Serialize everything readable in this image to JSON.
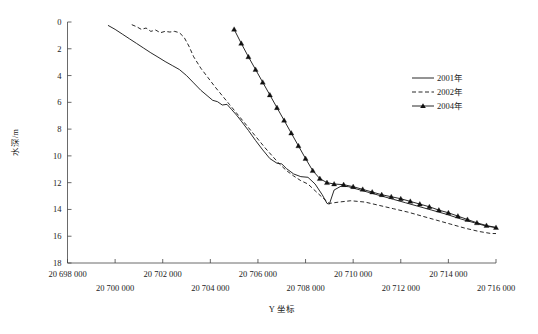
{
  "chart_data": {
    "type": "line",
    "title": "",
    "xlabel": "Y 坐标",
    "ylabel": "水深/m",
    "xlim": [
      20698000,
      20716000
    ],
    "ylim": [
      0,
      18
    ],
    "y_inverted": true,
    "grid": false,
    "legend_position": "right",
    "xticks": [
      20698000,
      20700000,
      20702000,
      20704000,
      20706000,
      20708000,
      20710000,
      20712000,
      20714000,
      20716000
    ],
    "xtick_labels": [
      "20 698 000",
      "20 700 000",
      "20 702 000",
      "20 704 000",
      "20 706 000",
      "20 708 000",
      "20 710 000",
      "20 712 000",
      "20 714 000",
      "20 716 000"
    ],
    "yticks": [
      0,
      2,
      4,
      6,
      8,
      10,
      12,
      14,
      16,
      18
    ],
    "ytick_labels": [
      "0",
      "2",
      "4",
      "6",
      "8",
      "10",
      "12",
      "14",
      "16",
      "18"
    ],
    "series": [
      {
        "name": "2001年",
        "style": "solid",
        "marker": "none",
        "color": "#111111",
        "points": [
          [
            20699700,
            0.25
          ],
          [
            20700000,
            0.55
          ],
          [
            20700300,
            0.9
          ],
          [
            20700600,
            1.25
          ],
          [
            20700900,
            1.6
          ],
          [
            20701200,
            1.95
          ],
          [
            20701500,
            2.3
          ],
          [
            20701800,
            2.62
          ],
          [
            20702100,
            2.95
          ],
          [
            20702400,
            3.25
          ],
          [
            20702700,
            3.55
          ],
          [
            20703000,
            4.0
          ],
          [
            20703300,
            4.55
          ],
          [
            20703600,
            5.1
          ],
          [
            20703900,
            5.55
          ],
          [
            20704100,
            5.85
          ],
          [
            20704300,
            5.95
          ],
          [
            20704500,
            6.2
          ],
          [
            20704700,
            6.15
          ],
          [
            20704900,
            6.55
          ],
          [
            20705100,
            6.95
          ],
          [
            20705300,
            7.4
          ],
          [
            20705600,
            8.1
          ],
          [
            20705900,
            8.85
          ],
          [
            20706200,
            9.55
          ],
          [
            20706500,
            10.2
          ],
          [
            20706800,
            10.55
          ],
          [
            20707000,
            10.6
          ],
          [
            20707200,
            10.95
          ],
          [
            20707500,
            11.35
          ],
          [
            20707800,
            11.55
          ],
          [
            20708100,
            11.6
          ],
          [
            20708400,
            12.1
          ],
          [
            20708700,
            12.9
          ],
          [
            20708900,
            13.55
          ],
          [
            20709000,
            13.6
          ],
          [
            20709200,
            12.55
          ],
          [
            20709500,
            12.25
          ],
          [
            20709800,
            12.3
          ],
          [
            20710200,
            12.5
          ],
          [
            20710700,
            12.75
          ],
          [
            20711200,
            13.0
          ],
          [
            20711700,
            13.25
          ],
          [
            20712200,
            13.5
          ],
          [
            20712700,
            13.75
          ],
          [
            20713300,
            14.05
          ],
          [
            20713900,
            14.35
          ],
          [
            20714500,
            14.7
          ],
          [
            20715100,
            15.0
          ],
          [
            20715600,
            15.25
          ],
          [
            20716000,
            15.35
          ]
        ]
      },
      {
        "name": "2002年",
        "style": "dashed",
        "marker": "none",
        "color": "#111111",
        "points": [
          [
            20700700,
            0.2
          ],
          [
            20700900,
            0.35
          ],
          [
            20701100,
            0.55
          ],
          [
            20701300,
            0.45
          ],
          [
            20701500,
            0.7
          ],
          [
            20701700,
            0.6
          ],
          [
            20701900,
            0.8
          ],
          [
            20702100,
            0.7
          ],
          [
            20702300,
            0.75
          ],
          [
            20702500,
            0.7
          ],
          [
            20702700,
            0.8
          ],
          [
            20702900,
            1.15
          ],
          [
            20703100,
            1.8
          ],
          [
            20703300,
            2.6
          ],
          [
            20703600,
            3.45
          ],
          [
            20703900,
            4.15
          ],
          [
            20704200,
            4.85
          ],
          [
            20704500,
            5.5
          ],
          [
            20704800,
            6.15
          ],
          [
            20705100,
            6.8
          ],
          [
            20705400,
            7.45
          ],
          [
            20705700,
            8.1
          ],
          [
            20706000,
            8.75
          ],
          [
            20706300,
            9.4
          ],
          [
            20706600,
            10.0
          ],
          [
            20706900,
            10.6
          ],
          [
            20707200,
            11.1
          ],
          [
            20707500,
            11.5
          ],
          [
            20707800,
            11.85
          ],
          [
            20708100,
            12.1
          ],
          [
            20708400,
            12.6
          ],
          [
            20708700,
            13.1
          ],
          [
            20709000,
            13.55
          ],
          [
            20709400,
            13.45
          ],
          [
            20709900,
            13.35
          ],
          [
            20710500,
            13.45
          ],
          [
            20711100,
            13.7
          ],
          [
            20711700,
            13.95
          ],
          [
            20712300,
            14.2
          ],
          [
            20712900,
            14.5
          ],
          [
            20713500,
            14.8
          ],
          [
            20714100,
            15.1
          ],
          [
            20714700,
            15.4
          ],
          [
            20715300,
            15.65
          ],
          [
            20715800,
            15.8
          ],
          [
            20716000,
            15.8
          ]
        ]
      },
      {
        "name": "2004年",
        "style": "solid",
        "marker": "triangle",
        "color": "#111111",
        "points": [
          [
            20705000,
            0.55
          ],
          [
            20705300,
            1.6
          ],
          [
            20705600,
            2.6
          ],
          [
            20705900,
            3.55
          ],
          [
            20706200,
            4.5
          ],
          [
            20706500,
            5.45
          ],
          [
            20706800,
            6.4
          ],
          [
            20707100,
            7.35
          ],
          [
            20707400,
            8.3
          ],
          [
            20707700,
            9.25
          ],
          [
            20708000,
            10.2
          ],
          [
            20708300,
            11.1
          ],
          [
            20708600,
            11.7
          ],
          [
            20708900,
            12.0
          ],
          [
            20709200,
            12.1
          ],
          [
            20709600,
            12.15
          ],
          [
            20710000,
            12.3
          ],
          [
            20710400,
            12.5
          ],
          [
            20710800,
            12.7
          ],
          [
            20711200,
            12.9
          ],
          [
            20711600,
            13.05
          ],
          [
            20712000,
            13.2
          ],
          [
            20712400,
            13.4
          ],
          [
            20712800,
            13.6
          ],
          [
            20713200,
            13.8
          ],
          [
            20713600,
            14.05
          ],
          [
            20714000,
            14.25
          ],
          [
            20714400,
            14.5
          ],
          [
            20714800,
            14.75
          ],
          [
            20715200,
            15.0
          ],
          [
            20715600,
            15.2
          ],
          [
            20716000,
            15.35
          ]
        ]
      }
    ]
  },
  "legend": {
    "items": [
      {
        "label": "2001年",
        "style": "solid",
        "marker": "none"
      },
      {
        "label": "2002年",
        "style": "dashed",
        "marker": "none"
      },
      {
        "label": "2004年",
        "style": "solid",
        "marker": "triangle"
      }
    ]
  },
  "axes": {
    "y_title": "水深/m",
    "x_title": "Y 坐标"
  }
}
